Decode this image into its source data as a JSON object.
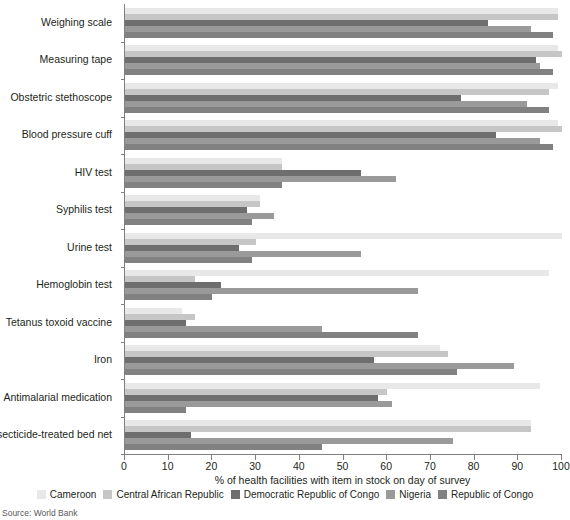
{
  "source_note": "Source: World Bank",
  "legend": {
    "position": "bottom",
    "items": [
      {
        "label": "Cameroon",
        "color": "#e8e8e8"
      },
      {
        "label": "Central African Republic",
        "color": "#c6c6c6"
      },
      {
        "label": "Democratic Republic of Congo",
        "color": "#6e6e6e"
      },
      {
        "label": "Nigeria",
        "color": "#9a9a9a"
      },
      {
        "label": "Republic of Congo",
        "color": "#818181"
      }
    ]
  },
  "axis": {
    "x_title": "% of health facilities with item in stock on day of survey",
    "x_ticks": [
      0,
      10,
      20,
      30,
      40,
      50,
      60,
      70,
      80,
      90,
      100
    ],
    "x_min": 0,
    "x_max": 100
  },
  "chart_data": {
    "type": "bar",
    "orientation": "horizontal",
    "title": "",
    "subtitle": "",
    "xlabel": "% of health facilities with item in stock on day of survey",
    "ylabel": "",
    "xlim": [
      0,
      100
    ],
    "grid": false,
    "legend_position": "bottom",
    "categories": [
      "Weighing scale",
      "Measuring tape",
      "Obstetric stethoscope",
      "Blood pressure cuff",
      "HIV test",
      "Syphilis test",
      "Urine test",
      "Hemoglobin test",
      "Tetanus toxoid vaccine",
      "Iron",
      "Antimalarial medication",
      "Insecticide-treated bed net"
    ],
    "series": [
      {
        "name": "Cameroon",
        "color": "#e8e8e8",
        "values": [
          99,
          99,
          99,
          99,
          36,
          31,
          100,
          97,
          13,
          72,
          95,
          93
        ]
      },
      {
        "name": "Central African Republic",
        "color": "#c6c6c6",
        "values": [
          99,
          100,
          97,
          100,
          36,
          31,
          30,
          16,
          16,
          74,
          60,
          93
        ]
      },
      {
        "name": "Democratic Republic of Congo",
        "color": "#6e6e6e",
        "values": [
          83,
          94,
          77,
          85,
          54,
          28,
          26,
          22,
          14,
          57,
          58,
          15
        ]
      },
      {
        "name": "Nigeria",
        "color": "#9a9a9a",
        "values": [
          93,
          95,
          92,
          95,
          62,
          34,
          54,
          67,
          45,
          89,
          61,
          75
        ]
      },
      {
        "name": "Republic of Congo",
        "color": "#818181",
        "values": [
          98,
          98,
          97,
          98,
          36,
          29,
          29,
          20,
          67,
          76,
          14,
          45
        ]
      }
    ]
  }
}
